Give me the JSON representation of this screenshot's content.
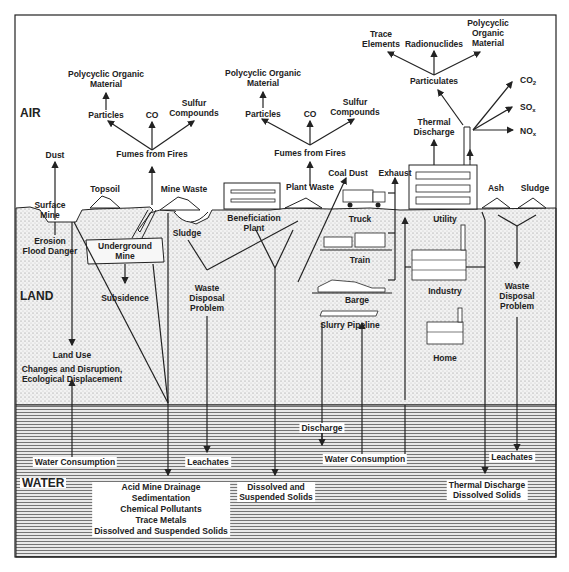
{
  "diagram": {
    "zones": {
      "air": "AIR",
      "land": "LAND",
      "water": "WATER"
    },
    "mining_fumes": {
      "poly_line1": "Polycyclic Organic",
      "poly_line2": "Material",
      "particles": "Particles",
      "co": "CO",
      "sulfur_line1": "Sulfur",
      "sulfur_line2": "Compounds",
      "fumes": "Fumes from Fires"
    },
    "plant_fumes": {
      "poly_line1": "Polycyclic Organic",
      "poly_line2": "Material",
      "particles": "Particles",
      "co": "CO",
      "sulfur_line1": "Sulfur",
      "sulfur_line2": "Compounds",
      "fumes": "Fumes from Fires"
    },
    "utility_emissions": {
      "trace_line1": "Trace",
      "trace_line2": "Elements",
      "radionuclides": "Radionuclides",
      "poly_line1": "Polycyclic",
      "poly_line2": "Organic",
      "poly_line3": "Material",
      "particulates": "Particulates",
      "co2": "CO",
      "co2_sub": "2",
      "sox": "SO",
      "sox_sub": "x",
      "nox": "NO",
      "nox_sub": "x",
      "thermal_line1": "Thermal",
      "thermal_line2": "Discharge"
    },
    "surface": {
      "dust": "Dust",
      "topsoil": "Topsoil",
      "mine_waste": "Mine Waste",
      "surface_mine_line1": "Surface",
      "surface_mine_line2": "Mine",
      "plant_waste": "Plant Waste",
      "coal_dust": "Coal Dust",
      "exhaust": "Exhaust",
      "ash": "Ash",
      "sludge": "Sludge"
    },
    "land": {
      "erosion_line1": "Erosion",
      "erosion_line2": "Flood Danger",
      "underground_line1": "Underground",
      "underground_line2": "Mine",
      "subsidence": "Subsidence",
      "sludge": "Sludge",
      "beneficiation_line1": "Beneficiation",
      "beneficiation_line2": "Plant",
      "waste_disposal_left_line1": "Waste",
      "waste_disposal_left_line2": "Disposal",
      "waste_disposal_left_line3": "Problem",
      "truck": "Truck",
      "train": "Train",
      "barge": "Barge",
      "slurry": "Slurry Pipeline",
      "utility": "Utility",
      "industry": "Industry",
      "home": "Home",
      "waste_disposal_right_line1": "Waste",
      "waste_disposal_right_line2": "Disposal",
      "waste_disposal_right_line3": "Problem",
      "land_use_line1": "Land Use",
      "land_use_line2": "Changes and Disruption,",
      "land_use_line3": "Ecological Displacement"
    },
    "water": {
      "water_consumption_left": "Water Consumption",
      "leachates_left": "Leachates",
      "discharge": "Discharge",
      "water_consumption_right": "Water Consumption",
      "leachates_right": "Leachates",
      "mine_effects": [
        "Acid Mine Drainage",
        "Sedimentation",
        "Chemical Pollutants",
        "Trace Metals",
        "Dissolved and Suspended Solids"
      ],
      "dissolved_line1": "Dissolved and",
      "dissolved_line2": "Suspended Solids",
      "thermal_line1": "Thermal Discharge",
      "thermal_line2": "Dissolved Solids"
    }
  }
}
